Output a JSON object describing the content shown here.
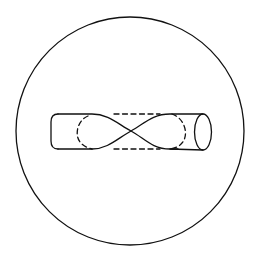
{
  "diagram": {
    "title": "Twisted cylinder (figure-eight cross-section) inside a circle",
    "stroke_color": "#111111",
    "background_color": "#ffffff",
    "outer_circle": {
      "cx": 130,
      "cy": 131,
      "r": 114
    },
    "elements": [
      {
        "name": "outer-circle",
        "type": "circle"
      },
      {
        "name": "cylinder-top-edge",
        "type": "path",
        "style": "solid"
      },
      {
        "name": "cylinder-bottom-edge",
        "type": "path",
        "style": "solid"
      },
      {
        "name": "twist-crossing",
        "type": "point",
        "x": 131,
        "y": 131
      },
      {
        "name": "top-dashed-line",
        "type": "line",
        "style": "dashed"
      },
      {
        "name": "bottom-dashed-line",
        "type": "line",
        "style": "dashed"
      },
      {
        "name": "left-hidden-arc",
        "type": "arc",
        "style": "dashed"
      },
      {
        "name": "right-hidden-arc",
        "type": "arc",
        "style": "dashed"
      },
      {
        "name": "right-end-ellipse",
        "type": "ellipse",
        "style": "solid"
      }
    ]
  }
}
